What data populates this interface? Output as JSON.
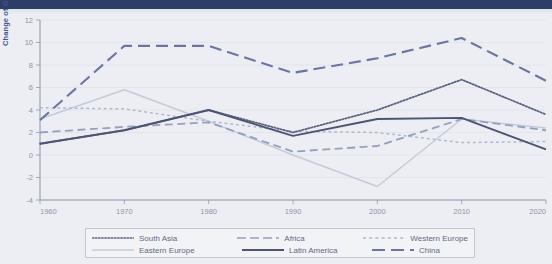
{
  "page": {
    "background_color": "#eceef3",
    "topbar_color": "#2e3d68"
  },
  "chart_data": {
    "type": "line",
    "title": "",
    "xlabel": "",
    "ylabel": "Change of GDP in capita in percent",
    "x": [
      1960,
      1970,
      1980,
      1990,
      2000,
      2010,
      2020
    ],
    "xticks": [
      "1960",
      "1970",
      "1980",
      "1990",
      "2000",
      "2010",
      "2020"
    ],
    "yticks": [
      "-4",
      "-2",
      "0",
      "2",
      "4",
      "6",
      "8",
      "10",
      "12"
    ],
    "ylim": [
      -4,
      12
    ],
    "xlim": [
      1960,
      2020
    ],
    "grid": true,
    "legend_position": "bottom",
    "series": [
      {
        "name": "South Asia",
        "style": "dotted",
        "color": "#5d6480",
        "values": [
          1.0,
          2.2,
          4.0,
          2.0,
          4.0,
          6.7,
          3.6
        ]
      },
      {
        "name": "Africa",
        "style": "dashed",
        "color": "#95a0ba",
        "values": [
          2.0,
          2.5,
          2.9,
          0.3,
          0.8,
          3.2,
          2.2
        ]
      },
      {
        "name": "Western Europe",
        "style": "fine-dashed",
        "color": "#aeb6c9",
        "values": [
          4.2,
          4.1,
          3.0,
          2.1,
          2.0,
          1.1,
          1.2
        ]
      },
      {
        "name": "Eastern Europe",
        "style": "solid-light",
        "color": "#c3cbdb",
        "values": [
          3.2,
          5.8,
          3.0,
          0.0,
          -2.8,
          3.2,
          2.4
        ]
      },
      {
        "name": "Latin America",
        "style": "solid",
        "color": "#4b5570",
        "values": [
          1.0,
          2.2,
          4.0,
          1.7,
          3.2,
          3.3,
          0.5
        ]
      },
      {
        "name": "China",
        "style": "long-dashed",
        "color": "#6b76a0",
        "values": [
          3.1,
          9.7,
          9.7,
          7.3,
          8.6,
          10.4,
          6.6
        ]
      }
    ]
  }
}
